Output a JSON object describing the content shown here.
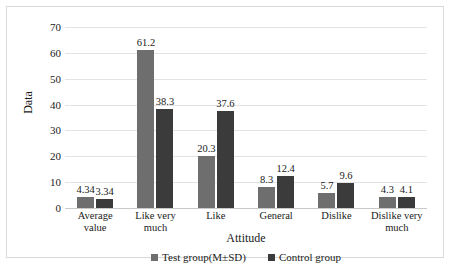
{
  "chart_data": {
    "type": "bar",
    "title": "",
    "xlabel": "Attitude",
    "ylabel": "Data",
    "ylim": [
      0,
      70
    ],
    "ytick_step": 10,
    "yticks": [
      70,
      60,
      50,
      40,
      30,
      20,
      10,
      0
    ],
    "grid": true,
    "legend_position": "bottom-center",
    "categories": [
      "Average value",
      "Like very much",
      "Like",
      "General",
      "Dislike",
      "Dislike very much"
    ],
    "category_lines": [
      [
        "Average",
        "value"
      ],
      [
        "Like very",
        "much"
      ],
      [
        "Like"
      ],
      [
        "General"
      ],
      [
        "Dislike"
      ],
      [
        "Dislike very",
        "much"
      ]
    ],
    "series": [
      {
        "name": "Test group(M±SD)",
        "color": "#6e6e6e",
        "values": [
          4.34,
          61.2,
          20.3,
          8.3,
          5.7,
          4.3
        ],
        "labels": [
          "4.34",
          "61.2",
          "20.3",
          "8.3",
          "5.7",
          "4.3"
        ]
      },
      {
        "name": "Control group",
        "color": "#3b3b3b",
        "values": [
          3.34,
          38.3,
          37.6,
          12.4,
          9.6,
          4.1
        ],
        "labels": [
          "3.34",
          "38.3",
          "37.6",
          "12.4",
          "9.6",
          "4.1"
        ]
      }
    ]
  }
}
